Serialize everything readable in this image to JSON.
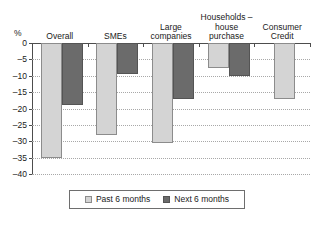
{
  "chart_data": {
    "type": "bar",
    "title": "",
    "subtitle": "",
    "xlabel": "",
    "ylabel": "%",
    "ylim": [
      -40,
      0
    ],
    "ytick_step": 5,
    "grid": true,
    "legend_position": "bottom",
    "categories": [
      "Overall",
      "SMEs",
      "Large\ncompanies",
      "Households –\nhouse\npurchase",
      "Consumer\nCredit"
    ],
    "ytick_labels": [
      "0",
      "–5",
      "–10",
      "–15",
      "–20",
      "–25",
      "–30",
      "–35",
      "–40"
    ],
    "ytick_values": [
      0,
      -5,
      -10,
      -15,
      -20,
      -25,
      -30,
      -35,
      -40
    ],
    "series": [
      {
        "name": "Past 6 months",
        "color": "#d4d4d4",
        "values": [
          -35,
          -28,
          -30.5,
          -7.5,
          -17
        ]
      },
      {
        "name": "Next 6 months",
        "color": "#6b6b6b",
        "values": [
          -19,
          -9.5,
          -17,
          -10,
          null
        ]
      }
    ]
  },
  "axis": {
    "unit_label": "%"
  },
  "legend": {
    "entries": [
      {
        "label": "Past 6 months",
        "swatch": "past"
      },
      {
        "label": "Next 6 months",
        "swatch": "next"
      }
    ]
  },
  "colors": {
    "past_bar": "#d4d4d4",
    "next_bar": "#6b6b6b",
    "axis": "#4d4d4d",
    "gridline": "#a8a8a8",
    "background": "#ffffff"
  }
}
